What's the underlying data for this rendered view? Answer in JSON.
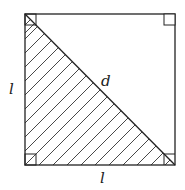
{
  "diagram": {
    "labels": {
      "left_side": "l",
      "bottom_side": "l",
      "diagonal": "d"
    },
    "shape": {
      "square": {
        "x": 25,
        "y": 14,
        "size": 150
      },
      "shaded_region": "lower-left triangle",
      "right_angle_markers": [
        "top-left",
        "top-right",
        "bottom-left",
        "bottom-right"
      ]
    },
    "colors": {
      "stroke": "#222222",
      "background": "#ffffff"
    }
  }
}
